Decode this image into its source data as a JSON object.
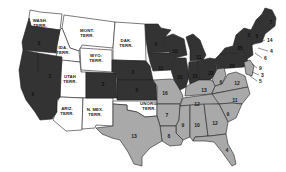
{
  "colors": {
    "dark_states": "#333333",
    "light_states": "#a9a9a9",
    "territories": "#ffffff",
    "border": "#222222"
  },
  "territories": [
    {
      "id": "wash",
      "label": "WASH.\nTERR.",
      "x": 40,
      "y": 23
    },
    {
      "id": "mont",
      "label": "MONT.\nTERR.",
      "x": 87,
      "y": 33
    },
    {
      "id": "dak",
      "label": "DAK.\nTERR.",
      "x": 126,
      "y": 43
    },
    {
      "id": "ida",
      "label": "IDA.\nTERR.",
      "x": 63,
      "y": 50
    },
    {
      "id": "wyo",
      "label": "WYO.\nTERR.",
      "x": 96,
      "y": 58
    },
    {
      "id": "utah",
      "label": "UTAH\nTERR.",
      "x": 70,
      "y": 79
    },
    {
      "id": "ariz",
      "label": "ARIZ.\nTERR.",
      "x": 67,
      "y": 111
    },
    {
      "id": "nmex",
      "label": "N. MEX.\nTERR.",
      "x": 95,
      "y": 112
    },
    {
      "id": "unorg",
      "label": "UNORG.\nTERR.",
      "x": 149,
      "y": 106
    }
  ],
  "states_dark": [
    {
      "id": "or",
      "num": "3",
      "x": 39,
      "y": 43
    },
    {
      "id": "nv",
      "num": "3",
      "x": 50,
      "y": 76
    },
    {
      "id": "ca",
      "num": "6",
      "x": 33,
      "y": 94
    },
    {
      "id": "co",
      "num": "3",
      "x": 103,
      "y": 84
    },
    {
      "id": "ne",
      "num": "3",
      "x": 133,
      "y": 72
    },
    {
      "id": "ks",
      "num": "5",
      "x": 137,
      "y": 90
    },
    {
      "id": "mn",
      "num": "5",
      "x": 156,
      "y": 44
    },
    {
      "id": "wi",
      "num": "10",
      "x": 175,
      "y": 51
    },
    {
      "id": "ia",
      "num": "11",
      "x": 161,
      "y": 68
    },
    {
      "id": "mi",
      "num": "11",
      "x": 199,
      "y": 57
    },
    {
      "id": "il",
      "num": "21",
      "x": 180,
      "y": 77
    },
    {
      "id": "in",
      "num": "15",
      "x": 195,
      "y": 76
    },
    {
      "id": "oh",
      "num": "22",
      "x": 211,
      "y": 73
    },
    {
      "id": "pa",
      "num": "29",
      "x": 232,
      "y": 66
    },
    {
      "id": "ny",
      "num": "35",
      "x": 240,
      "y": 48
    },
    {
      "id": "me",
      "num": "7",
      "x": 271,
      "y": 22
    },
    {
      "id": "vt",
      "num": "5",
      "x": 249,
      "y": 35
    },
    {
      "id": "nh",
      "num": "5",
      "x": 257,
      "y": 36
    }
  ],
  "states_light": [
    {
      "id": "mo",
      "num": "16",
      "x": 165,
      "y": 93
    },
    {
      "id": "ky",
      "num": "13",
      "x": 204,
      "y": 90
    },
    {
      "id": "wv",
      "num": "6",
      "x": 221,
      "y": 82
    },
    {
      "id": "va",
      "num": "12",
      "x": 237,
      "y": 83
    },
    {
      "id": "tn",
      "num": "12",
      "x": 197,
      "y": 104
    },
    {
      "id": "nc",
      "num": "11",
      "x": 235,
      "y": 100
    },
    {
      "id": "ar",
      "num": "7",
      "x": 167,
      "y": 115
    },
    {
      "id": "sc",
      "num": "9",
      "x": 228,
      "y": 114
    },
    {
      "id": "ms",
      "num": "9",
      "x": 183,
      "y": 125
    },
    {
      "id": "al",
      "num": "10",
      "x": 197,
      "y": 125
    },
    {
      "id": "ga",
      "num": "12",
      "x": 215,
      "y": 123
    },
    {
      "id": "la",
      "num": "8",
      "x": 169,
      "y": 136
    },
    {
      "id": "tx",
      "num": "13",
      "x": 134,
      "y": 136
    },
    {
      "id": "fl",
      "num": "4",
      "x": 227,
      "y": 150
    }
  ],
  "outer_labels": [
    {
      "id": "ma",
      "num": "14",
      "x": 267,
      "y": 40
    },
    {
      "id": "ri",
      "num": "4",
      "x": 270,
      "y": 51
    },
    {
      "id": "ct",
      "num": "6",
      "x": 264,
      "y": 58
    },
    {
      "id": "nj",
      "num": "9",
      "x": 259,
      "y": 68
    },
    {
      "id": "de",
      "num": "3",
      "x": 261,
      "y": 75
    },
    {
      "id": "md",
      "num": "5",
      "x": 259,
      "y": 81
    }
  ]
}
